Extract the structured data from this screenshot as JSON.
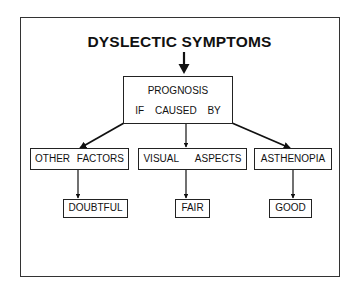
{
  "title": "DYSLECTIC SYMPTOMS",
  "prognosis": {
    "line1": "PROGNOSIS",
    "line2": "IF CAUSED BY"
  },
  "causes": [
    {
      "label": "OTHER FACTORS",
      "outcome": "DOUBTFUL"
    },
    {
      "label": "VISUAL ASPECTS",
      "outcome": "FAIR"
    },
    {
      "label": "ASTHENOPIA",
      "outcome": "GOOD"
    }
  ]
}
